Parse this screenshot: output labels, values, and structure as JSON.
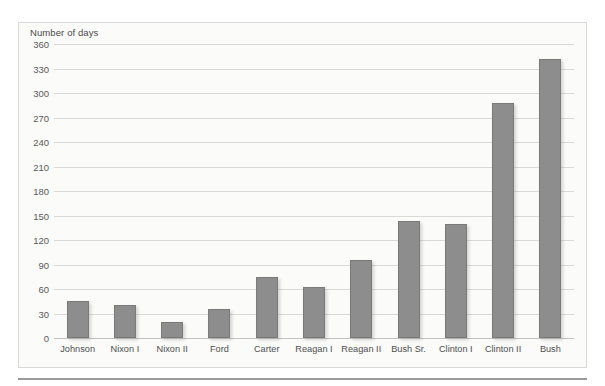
{
  "chart_data": {
    "type": "bar",
    "title": "",
    "xlabel": "",
    "ylabel": "Number of days",
    "ylim": [
      0,
      360
    ],
    "ytick_step": 30,
    "yticks": [
      0,
      30,
      60,
      90,
      120,
      150,
      180,
      210,
      240,
      270,
      300,
      330,
      360
    ],
    "grid": true,
    "legend": "none",
    "bar_color": "#8d8d8d",
    "bar_edge_color": "#7a7a7a",
    "plot_background": "#fbfbfa",
    "gridline_color": "#d9d9d7",
    "categories": [
      "Johnson",
      "Nixon I",
      "Nixon II",
      "Ford",
      "Carter",
      "Reagan I",
      "Reagan II",
      "Bush Sr.",
      "Clinton I",
      "Clinton II",
      "Bush"
    ],
    "values": [
      45,
      40,
      20,
      35,
      75,
      63,
      95,
      143,
      140,
      288,
      342
    ]
  }
}
